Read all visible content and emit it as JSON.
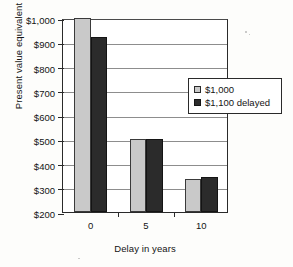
{
  "chart_data": {
    "type": "bar",
    "title": "",
    "xlabel": "Delay in years",
    "ylabel": "Present value equivalent",
    "categories": [
      "0",
      "5",
      "10"
    ],
    "series": [
      {
        "name": "$1,000",
        "color": "#c9c9c9",
        "values": [
          1000,
          500,
          335
        ]
      },
      {
        "name": "$1,100 delayed",
        "color": "#2b2b2b",
        "values": [
          920,
          500,
          345
        ]
      }
    ],
    "ylim": [
      200,
      1000
    ],
    "ytick_step": 100,
    "ytick_labels": [
      "$1,000",
      "$900",
      "$800",
      "$700",
      "$600",
      "$500",
      "$400",
      "$300",
      "$200"
    ],
    "ytick_values": [
      1000,
      900,
      800,
      700,
      600,
      500,
      400,
      300,
      200
    ],
    "grid": true,
    "legend_position": "right"
  },
  "legend": {
    "entries": [
      {
        "label": "$1,000"
      },
      {
        "label": "$1,100 delayed"
      }
    ]
  }
}
